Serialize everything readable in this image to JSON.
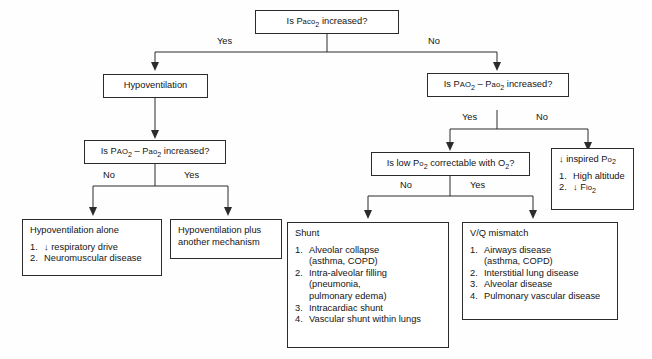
{
  "diagram": {
    "nodes": {
      "paco2": {
        "label_pre": "Is P",
        "label_sc": "aco",
        "label_sub": "2",
        "label_post": " increased?"
      },
      "hypoventilation": {
        "label": "Hypoventilation"
      },
      "gradient_left": {
        "p1_pre": "Is P",
        "p1_sc": "AO",
        "p1_sub": "2",
        "dash": " – ",
        "p2_pre": "P",
        "p2_sc": "ao",
        "p2_sub": "2",
        "post": " increased?"
      },
      "gradient_right": {
        "p1_pre": "Is P",
        "p1_sc": "AO",
        "p1_sub": "2",
        "dash": " – ",
        "p2_pre": "P",
        "p2_sc": "ao",
        "p2_sub": "2",
        "post": " increased?"
      },
      "po2_correctable": {
        "pre": "Is low P",
        "sc": "o",
        "sub": "2",
        "mid": " correctable with O",
        "sub2": "2",
        "post": "?"
      },
      "hypo_alone": {
        "title": "Hypoventilation alone",
        "items": [
          {
            "num": "1.",
            "text": "↓ respiratory drive"
          },
          {
            "num": "2.",
            "text": "Neuromuscular disease"
          }
        ]
      },
      "hypo_plus": {
        "line1": "Hypoventilation plus",
        "line2": "another mechanism"
      },
      "shunt": {
        "title": "Shunt",
        "items": [
          {
            "num": "1.",
            "text": "Alveolar collapse",
            "sub": "(asthma, COPD)"
          },
          {
            "num": "2.",
            "text": "Intra-alveolar filling",
            "sub": "(pneumonia,",
            "sub2": "pulmonary edema)"
          },
          {
            "num": "3.",
            "text": "Intracardiac shunt"
          },
          {
            "num": "4.",
            "text": "Vascular shunt within lungs"
          }
        ]
      },
      "vq_mismatch": {
        "title": "V/Q mismatch",
        "items": [
          {
            "num": "1.",
            "text": "Airways disease",
            "sub": "(asthma, COPD)"
          },
          {
            "num": "2.",
            "text": "Interstitial lung disease"
          },
          {
            "num": "3.",
            "text": "Alveolar disease"
          },
          {
            "num": "4.",
            "text": "Pulmonary vascular disease"
          }
        ]
      },
      "low_inspired_po2": {
        "title_pre": "↓ inspired P",
        "title_sc": "o",
        "title_sub": "2",
        "items": [
          {
            "num": "1.",
            "text": "High altitude"
          },
          {
            "num": "2.",
            "text": "↓ F",
            "sc": "io",
            "sub": "2"
          }
        ]
      }
    },
    "edges": {
      "paco2_yes": "Yes",
      "paco2_no": "No",
      "gradient_left_no": "No",
      "gradient_left_yes": "Yes",
      "gradient_right_yes": "Yes",
      "gradient_right_no": "No",
      "po2_no": "No",
      "po2_yes": "Yes"
    },
    "colors": {
      "line": "#2b2b2b",
      "text": "#141414",
      "background": "#fefefe"
    }
  }
}
